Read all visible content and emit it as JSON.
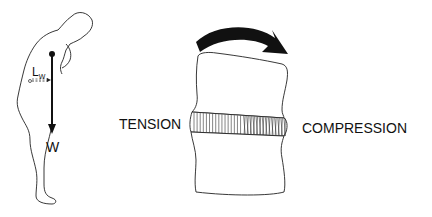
{
  "figure": {
    "type": "biomechanics-diagram",
    "person": {
      "weight_label": "W",
      "lever_arm_label": "L",
      "lever_arm_subscript": "W"
    },
    "spine_segment": {
      "left_label": "TENSION",
      "right_label": "COMPRESSION",
      "moment_arrow_direction": "clockwise"
    },
    "colors": {
      "line": "#222222",
      "arrow_fill": "#111111",
      "background": "#ffffff"
    }
  }
}
